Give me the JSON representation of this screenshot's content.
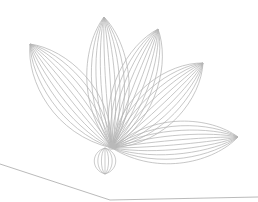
{
  "graphic": {
    "subject": "lotus-line-art",
    "stroke_color": "#b4b4b4",
    "background": "#ffffff",
    "base": [
      112,
      148
    ],
    "petals": [
      {
        "name": "left",
        "tip": [
          30,
          44
        ],
        "lines": 10,
        "width": 34
      },
      {
        "name": "upper-middle",
        "tip": [
          104,
          17
        ],
        "lines": 10,
        "width": 30
      },
      {
        "name": "upper-right",
        "tip": [
          158,
          29
        ],
        "lines": 10,
        "width": 30
      },
      {
        "name": "right",
        "tip": [
          203,
          63
        ],
        "lines": 10,
        "width": 32
      },
      {
        "name": "far-right",
        "tip": [
          238,
          137
        ],
        "lines": 10,
        "width": 30
      }
    ],
    "bud": {
      "center": [
        105,
        161
      ],
      "rx": 11,
      "ry": 13,
      "lines": 7
    },
    "ground_line": [
      [
        0,
        164
      ],
      [
        110,
        200
      ],
      [
        258,
        197
      ]
    ]
  }
}
